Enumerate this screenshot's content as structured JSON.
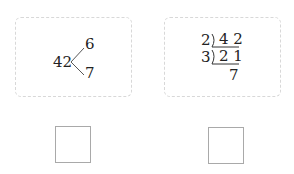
{
  "left_card": {
    "root": "42",
    "branches": [
      "6",
      "7"
    ]
  },
  "right_card": {
    "divisors": [
      "2",
      "3"
    ],
    "dividends": [
      "4 2",
      "2 1"
    ],
    "quotient": "7"
  },
  "answer_boxes": [
    {
      "value": ""
    },
    {
      "value": ""
    }
  ]
}
